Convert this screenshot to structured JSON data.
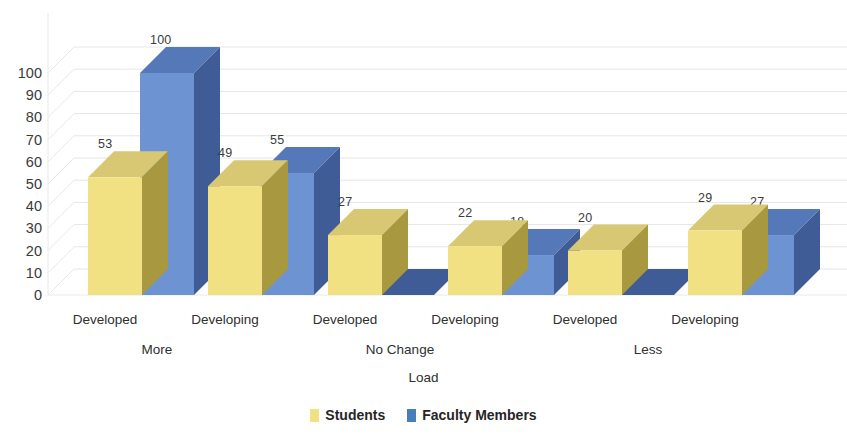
{
  "chart_data": {
    "type": "bar",
    "title": "",
    "xlabel": "Load",
    "ylabel": "",
    "ylim": [
      0,
      100
    ],
    "y_ticks": [
      0,
      10,
      20,
      30,
      40,
      50,
      60,
      70,
      80,
      90,
      100
    ],
    "grid": true,
    "legend_position": "bottom",
    "style": "3d-clustered-column",
    "categories": [
      "Developed",
      "Developing",
      "Developed",
      "Developing",
      "Developed",
      "Developing"
    ],
    "groups": [
      {
        "label": "More",
        "categories": [
          "Developed",
          "Developing"
        ]
      },
      {
        "label": "No Change",
        "categories": [
          "Developed",
          "Developing"
        ]
      },
      {
        "label": "Less",
        "categories": [
          "Developed",
          "Developing"
        ]
      }
    ],
    "series": [
      {
        "name": "Students",
        "color": "#F2E183",
        "values": [
          53,
          49,
          27,
          22,
          20,
          29
        ]
      },
      {
        "name": "Faculty Members",
        "color": "#6E93D2",
        "values": [
          100,
          55,
          0,
          18,
          0,
          27
        ]
      }
    ]
  },
  "axis": {
    "y_ticks": [
      "100",
      "90",
      "80",
      "70",
      "60",
      "50",
      "40",
      "30",
      "20",
      "10",
      "0"
    ],
    "x_title": "Load"
  },
  "category_labels": [
    "Developed",
    "Developing",
    "Developed",
    "Developing",
    "Developed",
    "Developing"
  ],
  "group_labels": [
    "More",
    "No Change",
    "Less"
  ],
  "value_labels": {
    "students": [
      "53",
      "49",
      "27",
      "22",
      "20",
      "29"
    ],
    "faculty": [
      "100",
      "55",
      "0",
      "18",
      "0",
      "27"
    ]
  },
  "legend": {
    "items": [
      {
        "label": "Students",
        "color": "#F2E183"
      },
      {
        "label": "Faculty Members",
        "color": "#4A7EBB"
      }
    ]
  },
  "colors": {
    "students_front": "#F2E183",
    "students_side": "#A89840",
    "students_top": "#D9C873",
    "faculty_front": "#6E93D2",
    "faculty_side": "#3F5C96",
    "faculty_top": "#5478B8",
    "gridline": "#E6E6E6",
    "wall_line": "#E8E8E8",
    "text": "#2f2f2f"
  }
}
